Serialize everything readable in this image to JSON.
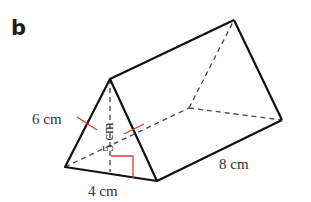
{
  "figure": {
    "part_label": "b",
    "shape": "triangular prism",
    "labels": {
      "slant_side": "6 cm",
      "height": "5 cm",
      "base": "4 cm",
      "length": "8 cm"
    },
    "colors": {
      "edge": "#111111",
      "hidden_edge": "#444444",
      "marker": "#e03a2a"
    }
  }
}
